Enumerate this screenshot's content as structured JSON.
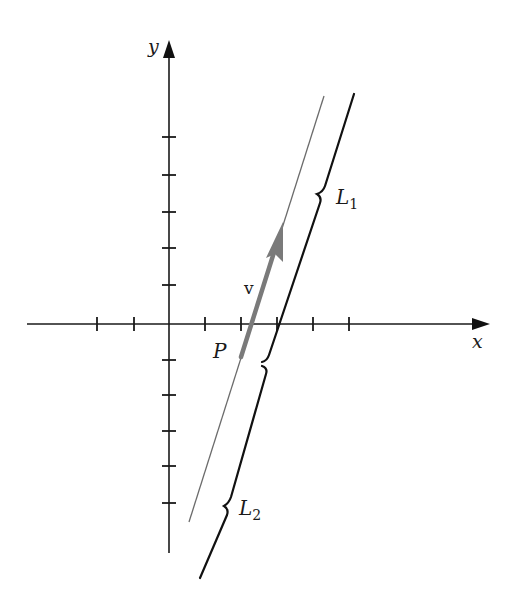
{
  "diagram": {
    "axes": {
      "x_label": "x",
      "y_label": "y",
      "x_ticks_px": [
        97,
        134,
        205,
        241,
        277,
        313,
        349
      ],
      "y_ticks_px": [
        137,
        175,
        212,
        248,
        285,
        360,
        395,
        431,
        466,
        503
      ]
    },
    "labels": {
      "vector": "v",
      "point": "P",
      "line1": "L",
      "line1_sub": "1",
      "line2": "L",
      "line2_sub": "2"
    },
    "colors": {
      "axis": "#1a1a1a",
      "thin_line": "#6b6b6b",
      "thick_line": "#111111",
      "vector": "#7a7a7a"
    }
  }
}
